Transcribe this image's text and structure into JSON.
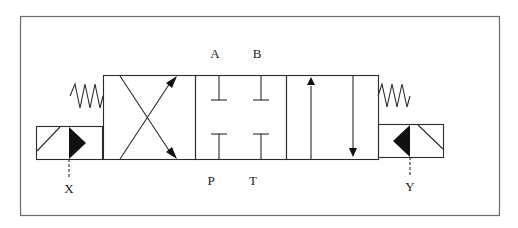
{
  "diagram": {
    "type": "4/3 directional control valve, solenoid operated, spring centered",
    "ports": {
      "top_left": "A",
      "top_right": "B",
      "bottom_left": "P",
      "bottom_right": "T"
    },
    "pilot_labels": {
      "left": "X",
      "right": "Y"
    },
    "positions": [
      "crossed",
      "closed-center",
      "parallel"
    ],
    "colors": {
      "line": "#2a2a2a",
      "frame": "#6a6a6a",
      "background": "#ffffff"
    }
  }
}
